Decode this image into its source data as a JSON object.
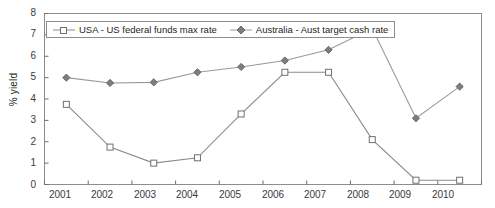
{
  "chart_data": {
    "type": "line",
    "title": "",
    "xlabel": "",
    "ylabel": "% yield",
    "categories": [
      "2001",
      "2002",
      "2003",
      "2004",
      "2005",
      "2006",
      "2007",
      "2008",
      "2009",
      "2010"
    ],
    "x": [
      2001,
      2002,
      2003,
      2004,
      2005,
      2006,
      2007,
      2008,
      2009,
      2010
    ],
    "ylim": [
      0,
      8
    ],
    "y_ticks": [
      "0",
      "1",
      "2",
      "3",
      "4",
      "5",
      "6",
      "7",
      "8"
    ],
    "grid": false,
    "legend_position": "top-left",
    "series": [
      {
        "name": "USA - US federal funds max rate",
        "marker": "open-square",
        "color": "#8a8a8a",
        "values": [
          3.75,
          1.75,
          1.0,
          1.25,
          3.3,
          5.25,
          5.25,
          2.1,
          0.2,
          0.2
        ]
      },
      {
        "name": "Australia - Aust target cash rate",
        "marker": "filled-diamond",
        "color": "#9a9a9a",
        "values": [
          5.0,
          4.75,
          4.78,
          5.25,
          5.5,
          5.8,
          6.3,
          7.3,
          3.1,
          4.58
        ]
      }
    ]
  },
  "legend": {
    "items": [
      {
        "label": "USA - US federal funds max rate",
        "marker": "open-square"
      },
      {
        "label": "Australia - Aust target cash rate",
        "marker": "filled-diamond"
      }
    ]
  },
  "axes": {
    "y_title": "% yield",
    "y_tick_labels": [
      "8",
      "7",
      "6",
      "5",
      "4",
      "3",
      "2",
      "1",
      "0"
    ],
    "x_tick_labels": [
      "2001",
      "2002",
      "2003",
      "2004",
      "2005",
      "2006",
      "2007",
      "2008",
      "2009",
      "2010"
    ]
  },
  "colors": {
    "usa_series": "#8a8a8a",
    "australia_series": "#9a9a9a",
    "axis": "#6d6d6d",
    "text": "#231f20"
  }
}
